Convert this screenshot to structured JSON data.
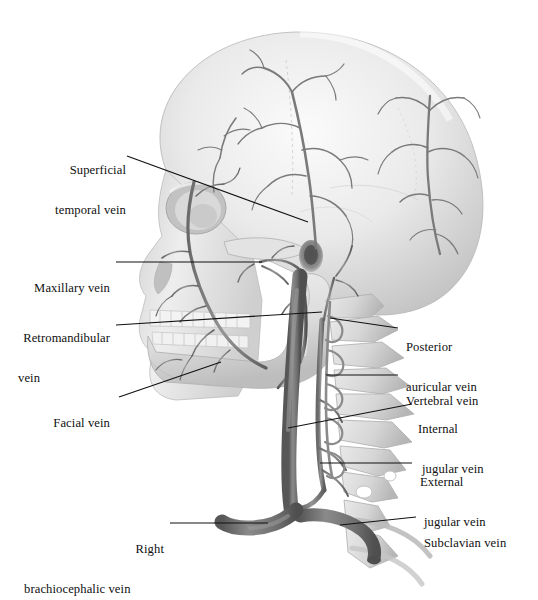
{
  "figure": {
    "view": "right lateral",
    "background_color": "#ffffff",
    "bone_color": "#e4e4e4",
    "bone_shadow_color": "#b9b9b9",
    "vessel_color": "#7c7c7c",
    "vessel_dark_color": "#5e5e5e",
    "leader_color": "#111111"
  },
  "labels": {
    "left": [
      {
        "id": "superficial-temporal-vein",
        "line1": "Superficial",
        "line2": "temporal vein"
      },
      {
        "id": "maxillary-vein",
        "line1": "Maxillary vein",
        "line2": ""
      },
      {
        "id": "retromandibular-vein",
        "line1": "Retromandibular",
        "line2": "vein"
      },
      {
        "id": "facial-vein",
        "line1": "Facial vein",
        "line2": ""
      },
      {
        "id": "right-brachiocephalic-vein",
        "line1": "Right",
        "line2": "brachiocephalic vein"
      }
    ],
    "right": [
      {
        "id": "posterior-auricular-vein",
        "line1": "Posterior",
        "line2": "auricular vein"
      },
      {
        "id": "vertebral-vein",
        "line1": "Vertebral vein",
        "line2": ""
      },
      {
        "id": "internal-jugular-vein",
        "line1": "Internal",
        "line2": "jugular vein"
      },
      {
        "id": "external-jugular-vein",
        "line1": "External",
        "line2": "jugular vein"
      },
      {
        "id": "subclavian-vein",
        "line1": "Subclavian vein",
        "line2": ""
      }
    ]
  },
  "structures": [
    {
      "id": "cranium",
      "name": "cranium"
    },
    {
      "id": "orbit",
      "name": "orbit"
    },
    {
      "id": "nasal-aperture",
      "name": "nasal aperture"
    },
    {
      "id": "maxilla-teeth",
      "name": "maxillary teeth"
    },
    {
      "id": "mandible",
      "name": "mandible"
    },
    {
      "id": "mandible-teeth",
      "name": "mandibular teeth"
    },
    {
      "id": "zygomatic-arch",
      "name": "zygomatic arch"
    },
    {
      "id": "external-acoustic-meatus",
      "name": "external acoustic meatus"
    },
    {
      "id": "mastoid-process",
      "name": "mastoid process"
    },
    {
      "id": "cervical-vertebrae",
      "name": "cervical vertebrae"
    },
    {
      "id": "first-rib",
      "name": "first rib"
    }
  ]
}
